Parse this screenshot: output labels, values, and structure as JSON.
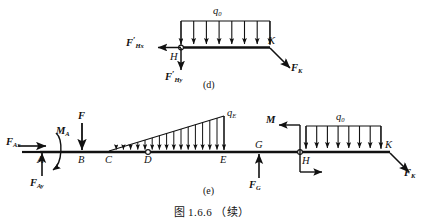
{
  "figure": {
    "caption": "图 1.6.6 （续）",
    "panels": [
      {
        "id": "d",
        "label": "(d)",
        "distributed_load_symbol": "q",
        "distributed_load_sub": "0",
        "arrow_count": 8,
        "points": [
          "H",
          "K"
        ],
        "forces": [
          {
            "name": "F'Hx",
            "base": "F",
            "prime": true,
            "sub": "Hx",
            "direction": "left"
          },
          {
            "name": "F'Hy",
            "base": "F",
            "prime": true,
            "sub": "Hy",
            "direction": "down"
          },
          {
            "name": "FK",
            "base": "F",
            "prime": false,
            "sub": "K",
            "direction": "down-right"
          }
        ]
      },
      {
        "id": "e",
        "label": "(e)",
        "points": [
          "A",
          "B",
          "C",
          "D",
          "E",
          "G",
          "H",
          "K"
        ],
        "triangular_load_symbol": "q",
        "triangular_load_sub": "E",
        "triangular_arrow_count": 16,
        "uniform_load_symbol": "q",
        "uniform_load_sub": "0",
        "uniform_arrow_count": 8,
        "forces": [
          {
            "name": "FAx",
            "base": "F",
            "prime": false,
            "sub": "Ax",
            "direction": "right"
          },
          {
            "name": "MA",
            "base": "M",
            "prime": false,
            "sub": "A",
            "direction": "moment-ccw"
          },
          {
            "name": "FAy",
            "base": "F",
            "prime": false,
            "sub": "Ay",
            "direction": "up"
          },
          {
            "name": "F",
            "base": "F",
            "prime": false,
            "sub": "",
            "direction": "down"
          },
          {
            "name": "FG",
            "base": "F",
            "prime": false,
            "sub": "G",
            "direction": "up"
          },
          {
            "name": "M",
            "base": "M",
            "prime": false,
            "sub": "",
            "direction": "left"
          },
          {
            "name": "FK",
            "base": "F",
            "prime": false,
            "sub": "K",
            "direction": "down-right"
          }
        ]
      }
    ]
  },
  "labels": {
    "d_q0": "q",
    "d_q0_sub": "0",
    "d_FHx": "F",
    "d_FHx_sub": "Hx",
    "d_FHy": "F",
    "d_FHy_sub": "Hy",
    "d_H": "H",
    "d_K": "K",
    "d_FK": "F",
    "d_FK_sub": "K",
    "d_panel": "(d)",
    "e_FAx": "F",
    "e_FAx_sub": "Ax",
    "e_MA": "M",
    "e_MA_sub": "A",
    "e_FAy": "F",
    "e_FAy_sub": "Ay",
    "e_F": "F",
    "e_A": "A",
    "e_B": "B",
    "e_C": "C",
    "e_D": "D",
    "e_E": "E",
    "e_G": "G",
    "e_H": "H",
    "e_K": "K",
    "e_qE": "q",
    "e_qE_sub": "E",
    "e_q0": "q",
    "e_q0_sub": "0",
    "e_FG": "F",
    "e_FG_sub": "G",
    "e_M": "M",
    "e_FK": "F",
    "e_FK_sub": "K",
    "e_panel": "(e)",
    "caption": "图 1.6.6 （续）"
  },
  "colors": {
    "ink": "#111111",
    "background": "#ffffff"
  }
}
